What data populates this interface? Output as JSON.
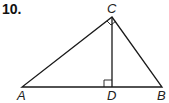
{
  "problem": {
    "number": "10."
  },
  "diagram": {
    "labels": {
      "A": "A",
      "B": "B",
      "C": "C",
      "D": "D"
    },
    "points": {
      "A": [
        22,
        87
      ],
      "B": [
        162,
        87
      ],
      "C": [
        112,
        17
      ],
      "D": [
        112,
        87
      ]
    },
    "right_angles": [
      "C",
      "D"
    ],
    "stroke_color": "#1a1a1a"
  }
}
